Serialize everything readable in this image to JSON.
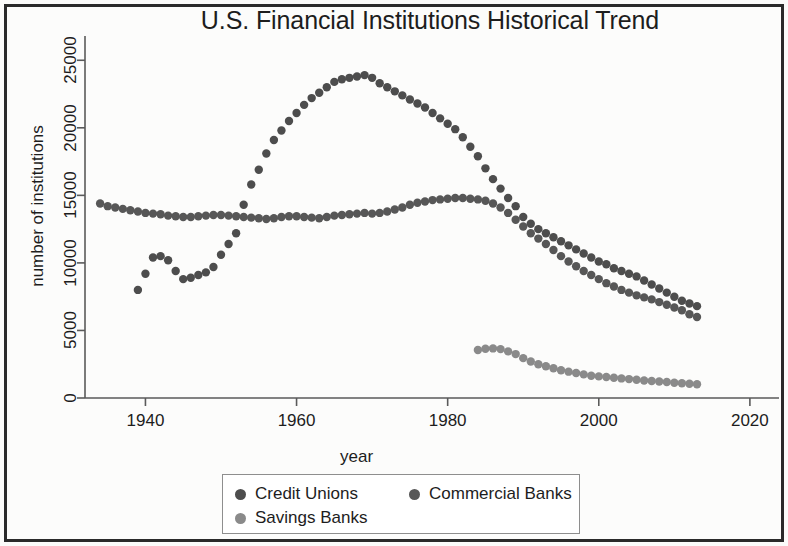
{
  "chart_data": {
    "type": "scatter",
    "title": "U.S. Financial Institutions Historical Trend",
    "xlabel": "year",
    "ylabel": "number of institutions",
    "xlim": [
      1932,
      2022
    ],
    "ylim": [
      0,
      26500
    ],
    "xticks": [
      1940,
      1960,
      1980,
      2000,
      2020
    ],
    "yticks": [
      0,
      5000,
      10000,
      15000,
      20000,
      25000
    ],
    "xtick_labels": [
      "1940",
      "1960",
      "1980",
      "2000",
      "2020"
    ],
    "ytick_labels": [
      "0",
      "5000",
      "10000",
      "15000",
      "20000",
      "25000"
    ],
    "grid": false,
    "legend_position": "bottom",
    "marker": "filled-circle",
    "series": [
      {
        "name": "Credit Unions",
        "color": "#4d4d4d",
        "x": [
          1939,
          1940,
          1941,
          1942,
          1943,
          1944,
          1945,
          1946,
          1947,
          1948,
          1949,
          1950,
          1951,
          1952,
          1953,
          1954,
          1955,
          1956,
          1957,
          1958,
          1959,
          1960,
          1961,
          1962,
          1963,
          1964,
          1965,
          1966,
          1967,
          1968,
          1969,
          1970,
          1971,
          1972,
          1973,
          1974,
          1975,
          1976,
          1977,
          1978,
          1979,
          1980,
          1981,
          1982,
          1983,
          1984,
          1985,
          1986,
          1987,
          1988,
          1989,
          1990,
          1991,
          1992,
          1993,
          1994,
          1995,
          1996,
          1997,
          1998,
          1999,
          2000,
          2001,
          2002,
          2003,
          2004,
          2005,
          2006,
          2007,
          2008,
          2009,
          2010,
          2011,
          2012,
          2013
        ],
        "y": [
          8000,
          9200,
          10400,
          10500,
          10200,
          9400,
          8800,
          8900,
          9100,
          9300,
          9700,
          10600,
          11400,
          12200,
          14300,
          15800,
          16900,
          18100,
          19100,
          19800,
          20500,
          21100,
          21700,
          22200,
          22600,
          23000,
          23400,
          23600,
          23700,
          23800,
          23900,
          23700,
          23300,
          23000,
          22700,
          22400,
          22100,
          21800,
          21500,
          21100,
          20700,
          20300,
          19900,
          19300,
          18600,
          17900,
          17000,
          16200,
          15500,
          14800,
          14200,
          13400,
          12900,
          12500,
          12200,
          11900,
          11600,
          11300,
          11000,
          10700,
          10400,
          10100,
          9900,
          9600,
          9400,
          9200,
          9000,
          8700,
          8400,
          8100,
          7800,
          7500,
          7200,
          7000,
          6800
        ]
      },
      {
        "name": "Commercial Banks",
        "color": "#575757",
        "x": [
          1934,
          1935,
          1936,
          1937,
          1938,
          1939,
          1940,
          1941,
          1942,
          1943,
          1944,
          1945,
          1946,
          1947,
          1948,
          1949,
          1950,
          1951,
          1952,
          1953,
          1954,
          1955,
          1956,
          1957,
          1958,
          1959,
          1960,
          1961,
          1962,
          1963,
          1964,
          1965,
          1966,
          1967,
          1968,
          1969,
          1970,
          1971,
          1972,
          1973,
          1974,
          1975,
          1976,
          1977,
          1978,
          1979,
          1980,
          1981,
          1982,
          1983,
          1984,
          1985,
          1986,
          1987,
          1988,
          1989,
          1990,
          1991,
          1992,
          1993,
          1994,
          1995,
          1996,
          1997,
          1998,
          1999,
          2000,
          2001,
          2002,
          2003,
          2004,
          2005,
          2006,
          2007,
          2008,
          2009,
          2010,
          2011,
          2012,
          2013
        ],
        "y": [
          14400,
          14200,
          14100,
          14000,
          13900,
          13800,
          13700,
          13650,
          13600,
          13500,
          13450,
          13400,
          13400,
          13450,
          13500,
          13550,
          13550,
          13500,
          13450,
          13400,
          13350,
          13300,
          13250,
          13300,
          13400,
          13450,
          13450,
          13400,
          13350,
          13300,
          13400,
          13500,
          13550,
          13600,
          13650,
          13700,
          13650,
          13700,
          13800,
          13950,
          14100,
          14300,
          14450,
          14550,
          14650,
          14700,
          14750,
          14800,
          14800,
          14750,
          14700,
          14600,
          14400,
          14100,
          13700,
          13200,
          12700,
          12200,
          11800,
          11400,
          10950,
          10500,
          10100,
          9750,
          9400,
          9100,
          8800,
          8500,
          8250,
          8000,
          7800,
          7600,
          7450,
          7300,
          7100,
          6900,
          6700,
          6500,
          6200,
          6000
        ]
      },
      {
        "name": "Savings Banks",
        "color": "#8a8a8a",
        "x": [
          1984,
          1985,
          1986,
          1987,
          1988,
          1989,
          1990,
          1991,
          1992,
          1993,
          1994,
          1995,
          1996,
          1997,
          1998,
          1999,
          2000,
          2001,
          2002,
          2003,
          2004,
          2005,
          2006,
          2007,
          2008,
          2009,
          2010,
          2011,
          2012,
          2013
        ],
        "y": [
          3550,
          3650,
          3670,
          3620,
          3450,
          3250,
          2950,
          2700,
          2500,
          2350,
          2200,
          2050,
          1950,
          1850,
          1750,
          1650,
          1600,
          1550,
          1500,
          1450,
          1400,
          1350,
          1300,
          1260,
          1220,
          1180,
          1130,
          1090,
          1050,
          1020
        ]
      }
    ]
  },
  "legend": {
    "entries": [
      {
        "label": "Credit Unions",
        "color": "#4d4d4d"
      },
      {
        "label": "Commercial Banks",
        "color": "#575757"
      },
      {
        "label": "Savings Banks",
        "color": "#8a8a8a"
      }
    ]
  },
  "axis_color": "#5a5a5a",
  "text_color": "#1d1d1d"
}
